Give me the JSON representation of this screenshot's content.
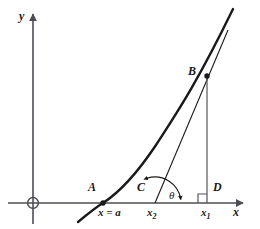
{
  "figure": {
    "type": "geometry-diagram",
    "background": "#ffffff",
    "ink_color": "#1a1a1a",
    "axis_color": "#4d4d55"
  },
  "axes": {
    "x_label": "x",
    "y_label": "y",
    "origin_marker": "circled-origin",
    "x_axis": {
      "x1": 8,
      "x2": 247,
      "y": 203
    },
    "y_axis": {
      "x": 33,
      "y1": 10,
      "y2": 224
    }
  },
  "points": [
    {
      "id": "A",
      "label": "A",
      "x": 103,
      "y": 203,
      "label_x": 88,
      "label_y": 191,
      "dot": true
    },
    {
      "id": "B",
      "label": "B",
      "x": 207,
      "y": 76,
      "label_x": 188,
      "label_y": 75,
      "dot": true
    },
    {
      "id": "C",
      "label": "C",
      "x": 155,
      "y": 203,
      "label_x": 137,
      "label_y": 191,
      "dot": false
    },
    {
      "id": "D",
      "label": "D",
      "x": 207,
      "y": 203,
      "label_x": 213,
      "label_y": 191,
      "dot": false
    }
  ],
  "tick_labels": [
    {
      "id": "x-eq-a",
      "text": "x = a",
      "x": 98,
      "y": 215
    },
    {
      "id": "x2",
      "base": "x",
      "subscript": "2",
      "x": 147,
      "y": 215
    },
    {
      "id": "x1",
      "base": "x",
      "subscript": "1",
      "x": 201,
      "y": 215
    }
  ],
  "angle": {
    "symbol": "θ",
    "label_x": 169,
    "label_y": 199,
    "arc_from_deg": 108,
    "arc_to_deg": 8,
    "vertex_x": 155,
    "vertex_y": 203,
    "radius": 26,
    "double_headed": true
  },
  "right_angle": {
    "at": "D",
    "x": 198,
    "y": 194,
    "size": 9
  },
  "curve": {
    "name": "exponential-curve",
    "description": "Convex increasing curve through A rising steeply to beyond B",
    "path": "M 78,222 C 90,212 98,206 103,203 C 120,192 138,172 156,145 C 176,114 196,85 233,9",
    "stroke_width": 2.4
  },
  "tangent_line": {
    "name": "tangent-at-B",
    "from_x": 155,
    "from_y": 203,
    "to_x": 228,
    "to_y": 30,
    "stroke_width": 1.1
  },
  "ordinate": {
    "name": "segment-BD",
    "x": 207,
    "y_top": 76,
    "y_bottom": 203,
    "stroke_width": 1.1
  }
}
